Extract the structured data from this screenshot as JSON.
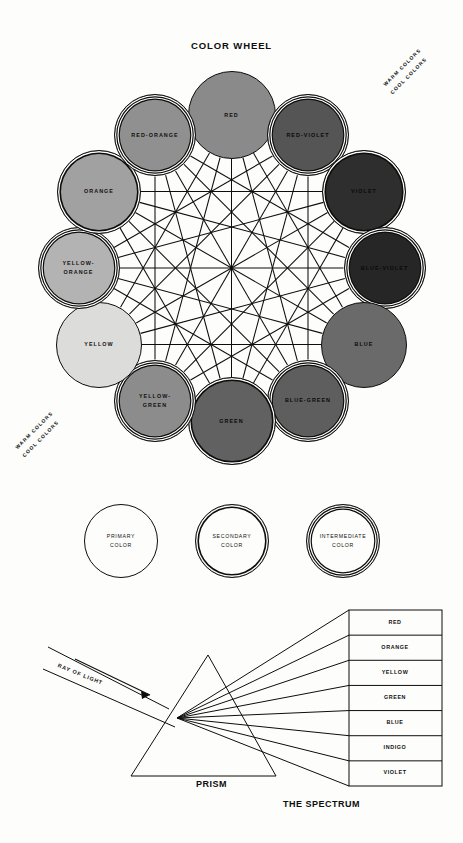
{
  "wheel": {
    "title": "COLOR WHEEL",
    "divider_labels": {
      "warm": "WARM COLORS",
      "cool": "COOL COLORS"
    },
    "nodes": [
      {
        "label": "RED",
        "kind": "primary",
        "rings": 1,
        "fill": "#8a8a8a",
        "angle": 0,
        "size": 88
      },
      {
        "label": "RED-VIOLET",
        "kind": "intermediate",
        "rings": 3,
        "fill": "#555555",
        "angle": 30,
        "size": 82
      },
      {
        "label": "VIOLET",
        "kind": "secondary",
        "rings": 2,
        "fill": "#2e2e2e",
        "angle": 60,
        "size": 84
      },
      {
        "label": "BLUE-VIOLET",
        "kind": "intermediate",
        "rings": 3,
        "fill": "#262626",
        "angle": 90,
        "size": 82
      },
      {
        "label": "BLUE",
        "kind": "primary",
        "rings": 1,
        "fill": "#6a6a6a",
        "angle": 120,
        "size": 86
      },
      {
        "label": "BLUE-GREEN",
        "kind": "intermediate",
        "rings": 3,
        "fill": "#5e5e5e",
        "angle": 150,
        "size": 82
      },
      {
        "label": "GREEN",
        "kind": "secondary",
        "rings": 2,
        "fill": "#616161",
        "angle": 180,
        "size": 88
      },
      {
        "label": "YELLOW-\nGREEN",
        "kind": "intermediate",
        "rings": 3,
        "fill": "#8c8c8c",
        "angle": 210,
        "size": 82
      },
      {
        "label": "YELLOW",
        "kind": "primary",
        "rings": 1,
        "fill": "#dcdcda",
        "angle": 240,
        "size": 86
      },
      {
        "label": "YELLOW-\nORANGE",
        "kind": "intermediate",
        "rings": 3,
        "fill": "#b3b3b3",
        "angle": 270,
        "size": 82
      },
      {
        "label": "ORANGE",
        "kind": "secondary",
        "rings": 2,
        "fill": "#a1a1a1",
        "angle": 300,
        "size": 84
      },
      {
        "label": "RED-ORANGE",
        "kind": "intermediate",
        "rings": 3,
        "fill": "#909090",
        "angle": 330,
        "size": 82
      }
    ]
  },
  "legend": {
    "items": [
      {
        "label": "PRIMARY\nCOLOR",
        "rings": 1
      },
      {
        "label": "SECONDARY\nCOLOR",
        "rings": 2
      },
      {
        "label": "INTERMEDIATE\nCOLOR",
        "rings": 3
      }
    ]
  },
  "prism": {
    "ray_label": "RAY OF LIGHT",
    "prism_label": "PRISM",
    "spectrum_label": "THE SPECTRUM",
    "bands": [
      "RED",
      "ORANGE",
      "YELLOW",
      "GREEN",
      "BLUE",
      "INDIGO",
      "VIOLET"
    ]
  },
  "colors": {
    "ink": "#0d0d0d",
    "paper": "#fdfdfb"
  }
}
